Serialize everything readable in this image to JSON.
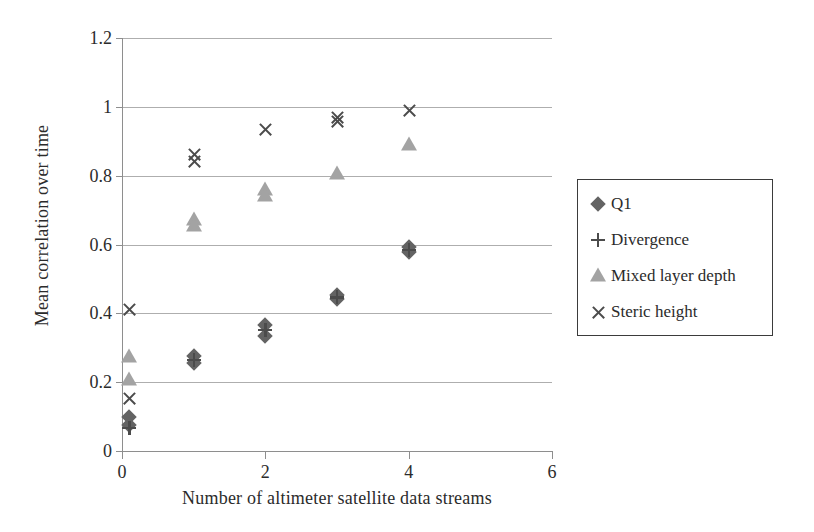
{
  "chart_data": {
    "type": "scatter",
    "title": "",
    "xlabel": "Number of altimeter satellite data streams",
    "ylabel": "Mean correlation over time",
    "xlim": [
      0,
      6
    ],
    "ylim": [
      0,
      1.2
    ],
    "xticks": [
      "0",
      "2",
      "4",
      "6"
    ],
    "xtick_values": [
      0,
      2,
      4,
      6
    ],
    "yticks": [
      "0",
      "0.2",
      "0.4",
      "0.6",
      "0.8",
      "1",
      "1.2"
    ],
    "ytick_values": [
      0,
      0.2,
      0.4,
      0.6,
      0.8,
      1,
      1.2
    ],
    "grid": "horizontal",
    "legend_position": "right",
    "series": [
      {
        "name": "Q1",
        "marker": "diamond",
        "color": "#636363",
        "points": [
          {
            "x": 0.1,
            "y": 0.1
          },
          {
            "x": 0.1,
            "y": 0.075
          },
          {
            "x": 1.0,
            "y": 0.275
          },
          {
            "x": 1.0,
            "y": 0.255
          },
          {
            "x": 2.0,
            "y": 0.365
          },
          {
            "x": 2.0,
            "y": 0.335
          },
          {
            "x": 3.0,
            "y": 0.452
          },
          {
            "x": 3.0,
            "y": 0.442
          },
          {
            "x": 4.0,
            "y": 0.592
          },
          {
            "x": 4.0,
            "y": 0.578
          }
        ]
      },
      {
        "name": "Divergence",
        "marker": "plus",
        "color": "#4b4b4b",
        "points": [
          {
            "x": 0.1,
            "y": 0.068
          },
          {
            "x": 1.0,
            "y": 0.265
          },
          {
            "x": 2.0,
            "y": 0.352
          },
          {
            "x": 3.0,
            "y": 0.447
          },
          {
            "x": 4.0,
            "y": 0.585
          }
        ]
      },
      {
        "name": "Mixed layer depth",
        "marker": "triangle",
        "color": "#a3a3a3",
        "points": [
          {
            "x": 0.1,
            "y": 0.272
          },
          {
            "x": 0.1,
            "y": 0.205
          },
          {
            "x": 1.0,
            "y": 0.672
          },
          {
            "x": 1.0,
            "y": 0.655
          },
          {
            "x": 2.0,
            "y": 0.757
          },
          {
            "x": 2.0,
            "y": 0.74
          },
          {
            "x": 3.0,
            "y": 0.805
          },
          {
            "x": 4.0,
            "y": 0.888
          }
        ]
      },
      {
        "name": "Steric height",
        "marker": "cross",
        "color": "#4b4b4b",
        "points": [
          {
            "x": 0.1,
            "y": 0.412
          },
          {
            "x": 0.1,
            "y": 0.152
          },
          {
            "x": 1.0,
            "y": 0.862
          },
          {
            "x": 1.0,
            "y": 0.84
          },
          {
            "x": 2.0,
            "y": 0.935
          },
          {
            "x": 3.0,
            "y": 0.97
          },
          {
            "x": 3.0,
            "y": 0.958
          },
          {
            "x": 4.0,
            "y": 0.99
          }
        ]
      }
    ]
  },
  "legend": {
    "items": [
      {
        "label": "Q1",
        "marker": "diamond"
      },
      {
        "label": "Divergence",
        "marker": "plus"
      },
      {
        "label": "Mixed layer depth",
        "marker": "triangle"
      },
      {
        "label": "Steric height",
        "marker": "cross"
      }
    ]
  }
}
